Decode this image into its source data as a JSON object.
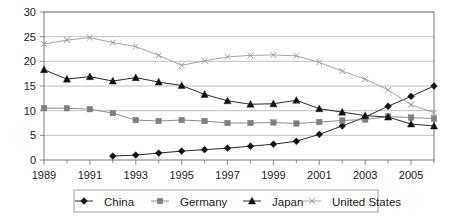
{
  "chart_data": {
    "type": "line",
    "title": "",
    "subtitle": "",
    "xlabel": "",
    "ylabel": "",
    "xlim": [
      1989,
      2006
    ],
    "ylim": [
      0,
      30
    ],
    "ytick_step": 5,
    "grid": true,
    "legend_position": "bottom",
    "x": [
      1989,
      1990,
      1991,
      1992,
      1993,
      1994,
      1995,
      1996,
      1997,
      1998,
      1999,
      2000,
      2001,
      2002,
      2003,
      2004,
      2005,
      2006
    ],
    "xticks": [
      1989,
      1991,
      1993,
      1995,
      1997,
      1999,
      2001,
      2003,
      2005
    ],
    "xtick_labels": [
      "1989",
      "1991",
      "1993",
      "1995",
      "1997",
      "1999",
      "2001",
      "2003",
      "2005"
    ],
    "yticks": [
      0,
      5,
      10,
      15,
      20,
      25,
      30
    ],
    "ytick_labels": [
      "0",
      "5",
      "10",
      "15",
      "20",
      "25",
      "30"
    ],
    "series": [
      {
        "name": "China",
        "marker": "diamond",
        "color": "#111111",
        "x": [
          1992,
          1993,
          1994,
          1995,
          1996,
          1997,
          1998,
          1999,
          2000,
          2001,
          2002,
          2003,
          2004,
          2005,
          2006
        ],
        "values": [
          0.8,
          1.0,
          1.4,
          1.8,
          2.1,
          2.4,
          2.8,
          3.2,
          3.8,
          5.2,
          6.9,
          8.7,
          10.9,
          12.9,
          15.0
        ]
      },
      {
        "name": "Germany",
        "marker": "square",
        "color": "#808080",
        "x": [
          1989,
          1990,
          1991,
          1992,
          1993,
          1994,
          1995,
          1996,
          1997,
          1998,
          1999,
          2000,
          2001,
          2002,
          2003,
          2004,
          2005,
          2006
        ],
        "values": [
          10.5,
          10.5,
          10.3,
          9.5,
          8.1,
          7.9,
          8.1,
          7.9,
          7.5,
          7.5,
          7.6,
          7.4,
          7.7,
          8.0,
          8.2,
          8.8,
          8.6,
          8.4
        ]
      },
      {
        "name": "Japan",
        "marker": "triangle",
        "color": "#111111",
        "x": [
          1989,
          1990,
          1991,
          1992,
          1993,
          1994,
          1995,
          1996,
          1997,
          1998,
          1999,
          2000,
          2001,
          2002,
          2003,
          2004,
          2005,
          2006
        ],
        "values": [
          18.3,
          16.4,
          16.9,
          16.0,
          16.7,
          15.8,
          15.1,
          13.3,
          12.0,
          11.3,
          11.4,
          12.1,
          10.4,
          9.7,
          9.0,
          8.7,
          7.3,
          6.9
        ]
      },
      {
        "name": "United States",
        "marker": "x",
        "color": "#9a9a9a",
        "x": [
          1989,
          1990,
          1991,
          1992,
          1993,
          1994,
          1995,
          1996,
          1997,
          1998,
          1999,
          2000,
          2001,
          2002,
          2003,
          2004,
          2005,
          2006
        ],
        "values": [
          23.5,
          24.3,
          24.8,
          23.8,
          23.0,
          21.2,
          19.2,
          20.1,
          20.9,
          21.2,
          21.3,
          21.1,
          19.8,
          18.0,
          16.4,
          14.2,
          11.2,
          9.6
        ]
      }
    ]
  },
  "legend": {
    "items": [
      {
        "label": "China",
        "marker": "diamond",
        "color": "#111111"
      },
      {
        "label": "Germany",
        "marker": "square",
        "color": "#808080"
      },
      {
        "label": "Japan",
        "marker": "triangle",
        "color": "#111111"
      },
      {
        "label": "United States",
        "marker": "x",
        "color": "#9a9a9a"
      }
    ]
  }
}
